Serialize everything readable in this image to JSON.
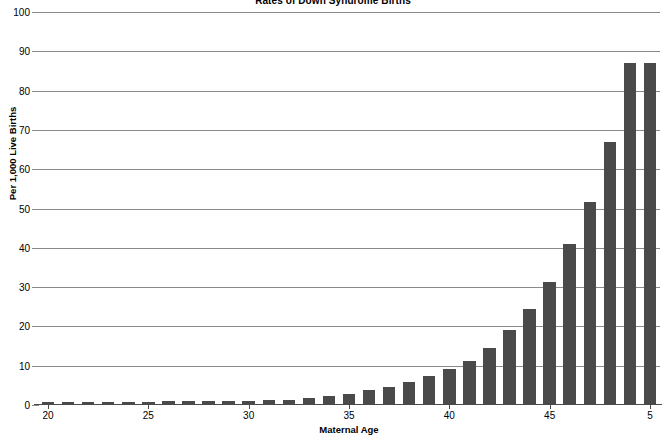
{
  "chart_data": {
    "type": "bar",
    "title": "Rates of Down Syndrome Births",
    "xlabel": "Maternal Age",
    "ylabel": "Per 1,000 Live Births",
    "ylim": [
      0,
      100
    ],
    "ytick_labels": [
      "0",
      "10",
      "20",
      "30",
      "40",
      "50",
      "60",
      "70",
      "80",
      "90",
      "100"
    ],
    "ytick_values": [
      0,
      10,
      20,
      30,
      40,
      50,
      60,
      70,
      80,
      90,
      100
    ],
    "xlim": [
      19.5,
      50.5
    ],
    "xtick_labels": [
      "20",
      "25",
      "30",
      "35",
      "40",
      "45",
      "5"
    ],
    "xtick_values": [
      20,
      25,
      30,
      35,
      40,
      45,
      50
    ],
    "grid": true,
    "legend": "none",
    "bar_color": "#4a4a4a",
    "gridline_color": "#8a8a8a",
    "categories": [
      20,
      21,
      22,
      23,
      24,
      25,
      26,
      27,
      28,
      29,
      30,
      31,
      32,
      33,
      34,
      35,
      36,
      37,
      38,
      39,
      40,
      41,
      42,
      43,
      44,
      45,
      46,
      47,
      48,
      49,
      50
    ],
    "values": [
      0.7,
      0.7,
      0.7,
      0.7,
      0.8,
      0.8,
      0.9,
      0.9,
      0.9,
      1.0,
      1.1,
      1.2,
      1.3,
      1.9,
      2.4,
      2.9,
      3.7,
      4.5,
      5.8,
      7.3,
      9.1,
      11.2,
      14.6,
      19.2,
      24.4,
      31.4,
      41.0,
      51.6,
      67.0,
      87.0,
      87.0
    ],
    "bar_count": 31
  }
}
